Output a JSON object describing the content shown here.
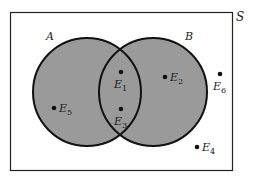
{
  "diagram": {
    "type": "venn",
    "universe": {
      "label": "S"
    },
    "sets": [
      {
        "id": "A",
        "label": "A"
      },
      {
        "id": "B",
        "label": "B"
      }
    ],
    "shaded_region": "A ∪ B",
    "colors": {
      "fill": "#9a9a9a",
      "stroke": "#111111",
      "background": "#ffffff"
    },
    "elements": [
      {
        "name": "E",
        "sub": "1",
        "region": "A ∩ B"
      },
      {
        "name": "E",
        "sub": "2",
        "region": "B only"
      },
      {
        "name": "E",
        "sub": "3",
        "region": "A ∩ B"
      },
      {
        "name": "E",
        "sub": "4",
        "region": "outside A ∪ B"
      },
      {
        "name": "E",
        "sub": "5",
        "region": "A only"
      },
      {
        "name": "E",
        "sub": "6",
        "region": "outside A ∪ B"
      }
    ]
  }
}
